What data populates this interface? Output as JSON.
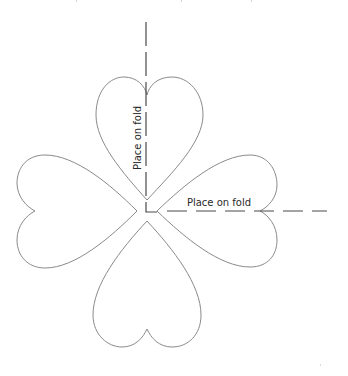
{
  "diagram": {
    "type": "four-leaf clover sewing/cutting template",
    "colors": {
      "background": "#ffffff",
      "outline": "#8a8a8a",
      "fold_line": "#4a4a4a",
      "label_text": "#2a2a2a"
    },
    "petals": [
      {
        "id": "top",
        "orientation": "tip-down",
        "tip": [
          147,
          200
        ],
        "notch": [
          147,
          95
        ]
      },
      {
        "id": "right",
        "orientation": "tip-left",
        "tip": [
          157,
          211
        ],
        "notch": [
          260,
          211
        ]
      },
      {
        "id": "bottom",
        "orientation": "tip-up",
        "tip": [
          147,
          221
        ],
        "notch": [
          147,
          329
        ]
      },
      {
        "id": "left",
        "orientation": "tip-right",
        "tip": [
          137,
          211
        ],
        "notch": [
          35,
          211
        ]
      }
    ],
    "fold_lines": [
      {
        "id": "vertical",
        "label": "Place on fold",
        "from": [
          146,
          22
        ],
        "to": [
          146,
          212
        ]
      },
      {
        "id": "horizontal",
        "label": "Place on fold",
        "from": [
          167,
          211
        ],
        "to": [
          327,
          211
        ]
      }
    ],
    "labels": {
      "vertical_fold": "Place on fold",
      "horizontal_fold": "Place on fold"
    }
  }
}
